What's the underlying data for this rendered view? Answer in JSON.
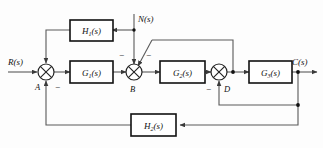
{
  "diagram": {
    "type": "control-system-block-diagram",
    "signals": {
      "input": "R(s)",
      "disturbance": "N(s)",
      "output": "C(s)"
    },
    "blocks": [
      {
        "id": "H1",
        "base": "H",
        "subscript": "1",
        "arg": "(s)",
        "label": "H₁(s)",
        "row": "top"
      },
      {
        "id": "G1",
        "base": "G",
        "subscript": "1",
        "arg": "(s)",
        "label": "G₁(s)",
        "row": "main"
      },
      {
        "id": "G2",
        "base": "G",
        "subscript": "2",
        "arg": "(s)",
        "label": "G₂(s)",
        "row": "main"
      },
      {
        "id": "G3",
        "base": "G",
        "subscript": "3",
        "arg": "(s)",
        "label": "G₃(s)",
        "row": "main"
      },
      {
        "id": "H2",
        "base": "H",
        "subscript": "2",
        "arg": "(s)",
        "label": "H₂(s)",
        "row": "bottom"
      }
    ],
    "summing_junctions": [
      {
        "id": "A",
        "label": "A",
        "signs": [
          "-"
        ]
      },
      {
        "id": "B",
        "label": "B",
        "signs": [
          "-",
          "-"
        ]
      },
      {
        "id": "D",
        "label": "D",
        "signs": [
          "-"
        ]
      }
    ],
    "sign_marks": {
      "junction_a": "−",
      "junction_b_vertical": "−",
      "junction_b_diagonal": "−",
      "junction_d": "−"
    }
  }
}
